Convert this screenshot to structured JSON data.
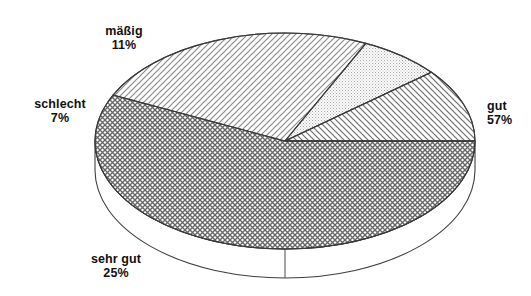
{
  "chart_data": {
    "type": "pie",
    "title": "",
    "subtitle": "",
    "xlabel": "",
    "ylabel": "",
    "legend_position": "none",
    "grid": false,
    "style": "3d-exploded-none",
    "unit": "%",
    "categories": [
      "gut",
      "sehr gut",
      "mäßig",
      "schlecht"
    ],
    "values": [
      57,
      25,
      11,
      7
    ],
    "slices": [
      {
        "label": "gut",
        "value": 57,
        "value_text": "57%",
        "pattern": "cross-hatch",
        "pattern_color": "#555555",
        "fill": "#ffffff",
        "start_angle_deg": 0,
        "end_angle_deg": 205.2,
        "label_position": "right"
      },
      {
        "label": "sehr gut",
        "value": 25,
        "value_text": "25%",
        "pattern": "diagonal-forward",
        "pattern_color": "#777777",
        "fill": "#ffffff",
        "start_angle_deg": 205.2,
        "end_angle_deg": 295.2,
        "label_position": "bottom-left"
      },
      {
        "label": "schlecht",
        "value": 7,
        "value_text": "7%",
        "pattern": "stipple-dots",
        "pattern_color": "#9a9a9a",
        "fill": "#f7f7f7",
        "start_angle_deg": 295.2,
        "end_angle_deg": 320.4,
        "label_position": "left"
      },
      {
        "label": "mäßig",
        "value": 11,
        "value_text": "11%",
        "pattern": "diagonal-backward",
        "pattern_color": "#666666",
        "fill": "#ffffff",
        "start_angle_deg": 320.4,
        "end_angle_deg": 360,
        "label_position": "top-left"
      }
    ],
    "colors": {
      "background": "#ffffff",
      "outline": "#3a3a3a",
      "text": "#111111"
    }
  },
  "labels": {
    "maessig": {
      "name": "mäßig",
      "pct": "11%"
    },
    "schlecht": {
      "name": "schlecht",
      "pct": "7%"
    },
    "gut": {
      "name": "gut",
      "pct": "57%"
    },
    "sehr_gut": {
      "name": "sehr gut",
      "pct": "25%"
    }
  }
}
